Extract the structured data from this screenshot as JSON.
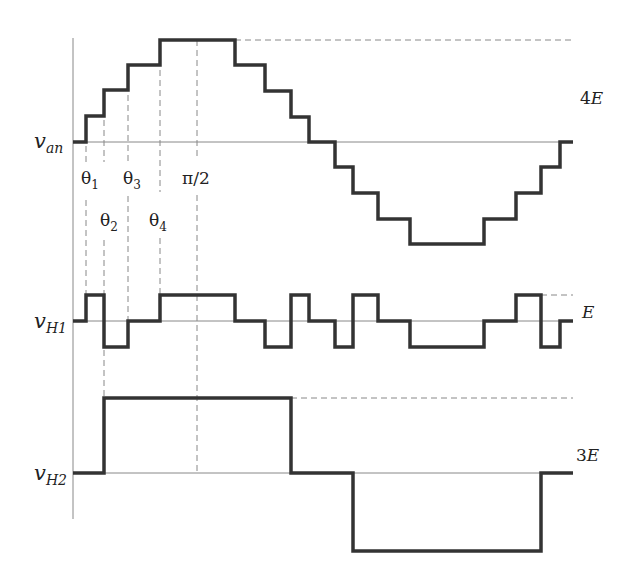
{
  "diagram": {
    "colors": {
      "wave": "#333333",
      "axis": "#888888",
      "dash": "#888888",
      "text": "#222222"
    },
    "labels": {
      "van": "v",
      "van_sub": "an",
      "vh1": "v",
      "vh1_sub": "H1",
      "vh2": "v",
      "vh2_sub": "H2",
      "theta1": "θ",
      "theta1_sub": "1",
      "theta2": "θ",
      "theta2_sub": "2",
      "theta3": "θ",
      "theta3_sub": "3",
      "theta4": "θ",
      "theta4_sub": "4",
      "pi_half": "π/2",
      "amp_van": "4",
      "amp_van_unit": "E",
      "amp_vh1": "E",
      "amp_vh2": "3",
      "amp_vh2_unit": "E"
    },
    "angles": [
      "θ1",
      "θ2",
      "θ3",
      "θ4",
      "π/2"
    ],
    "waveforms": [
      {
        "name": "v_an",
        "levels": [
          0,
          1,
          2,
          3,
          4,
          3,
          2,
          1,
          0,
          -1,
          -2,
          -3,
          -4,
          -3,
          -2,
          -1,
          0
        ],
        "amplitude": "4E"
      },
      {
        "name": "v_H1",
        "levels": [
          0,
          1,
          -1,
          0,
          1,
          0,
          -1,
          1,
          0,
          -1,
          1,
          0,
          -1,
          0,
          1,
          -1,
          0
        ],
        "amplitude": "E"
      },
      {
        "name": "v_H2",
        "levels": [
          0,
          1,
          0,
          -1,
          0
        ],
        "amplitude": "3E"
      }
    ]
  }
}
